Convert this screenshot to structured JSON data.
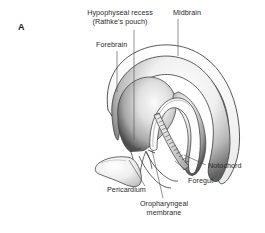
{
  "figure": {
    "panel_label": "A",
    "caption_present": false,
    "background_color": "#ffffff",
    "ink_color": "#2b2b2b",
    "shade_color": "#6d6d6d"
  },
  "annotations": [
    {
      "id": "hypophyseal-recess",
      "lines": [
        "Hypophyseal recess",
        "(Rathke's pouch)"
      ],
      "text": "Hypophyseal recess\n(Rathke's pouch)",
      "align": "center",
      "x": 76,
      "y": 8,
      "width": 88,
      "leader": {
        "x1": 134,
        "y1": 30,
        "x2": 134,
        "y2": 140
      }
    },
    {
      "id": "midbrain",
      "lines": [
        "Midbrain"
      ],
      "text": "Midbrain",
      "align": "left",
      "x": 173,
      "y": 8,
      "width": 46,
      "leader": {
        "x1": 178,
        "y1": 19,
        "x2": 178,
        "y2": 56
      }
    },
    {
      "id": "forebrain",
      "lines": [
        "Forebrain"
      ],
      "text": "Forebrain",
      "align": "left",
      "x": 96,
      "y": 40,
      "width": 44,
      "leader": {
        "x1": 117,
        "y1": 51,
        "x2": 117,
        "y2": 92
      }
    },
    {
      "id": "notochord",
      "lines": [
        "Notochord"
      ],
      "text": "Notochord",
      "align": "left",
      "x": 208,
      "y": 161,
      "width": 50,
      "leader": {
        "x1": 206,
        "y1": 165,
        "x2": 184,
        "y2": 155
      }
    },
    {
      "id": "foregut",
      "lines": [
        "Foregut"
      ],
      "text": "Foregut",
      "align": "left",
      "x": 188,
      "y": 176,
      "width": 38,
      "leader": {
        "x1": 193,
        "y1": 176,
        "x2": 175,
        "y2": 161
      }
    },
    {
      "id": "pericardium",
      "lines": [
        "Pericardium"
      ],
      "text": "Pericardium",
      "align": "left",
      "x": 107,
      "y": 185,
      "width": 52,
      "leader": {
        "x1": 145,
        "y1": 186,
        "x2": 129,
        "y2": 160
      }
    },
    {
      "id": "oropharyngeal-membrane",
      "lines": [
        "Oropharyngeal",
        "membrane"
      ],
      "text": "Oropharyngeal\nmembrane",
      "align": "center",
      "x": 131,
      "y": 199,
      "width": 66,
      "leader": {
        "x1": 163,
        "y1": 198,
        "x2": 152,
        "y2": 150
      }
    }
  ],
  "structures": [
    {
      "id": "neural-tube-outer-wall",
      "name": "Neural tube outer wall"
    },
    {
      "id": "neural-tube-inner-wall",
      "name": "Neural tube inner wall"
    },
    {
      "id": "forebrain-vesicle",
      "name": "Forebrain vesicle"
    },
    {
      "id": "midbrain-flexure",
      "name": "Midbrain region"
    },
    {
      "id": "rathkes-pouch-cavity",
      "name": "Hypophyseal recess cavity"
    },
    {
      "id": "notochord-band",
      "name": "Notochord"
    },
    {
      "id": "foregut-tube",
      "name": "Foregut"
    },
    {
      "id": "pericardium-sac",
      "name": "Pericardium"
    },
    {
      "id": "oropharyngeal-membrane-line",
      "name": "Oropharyngeal membrane"
    }
  ]
}
